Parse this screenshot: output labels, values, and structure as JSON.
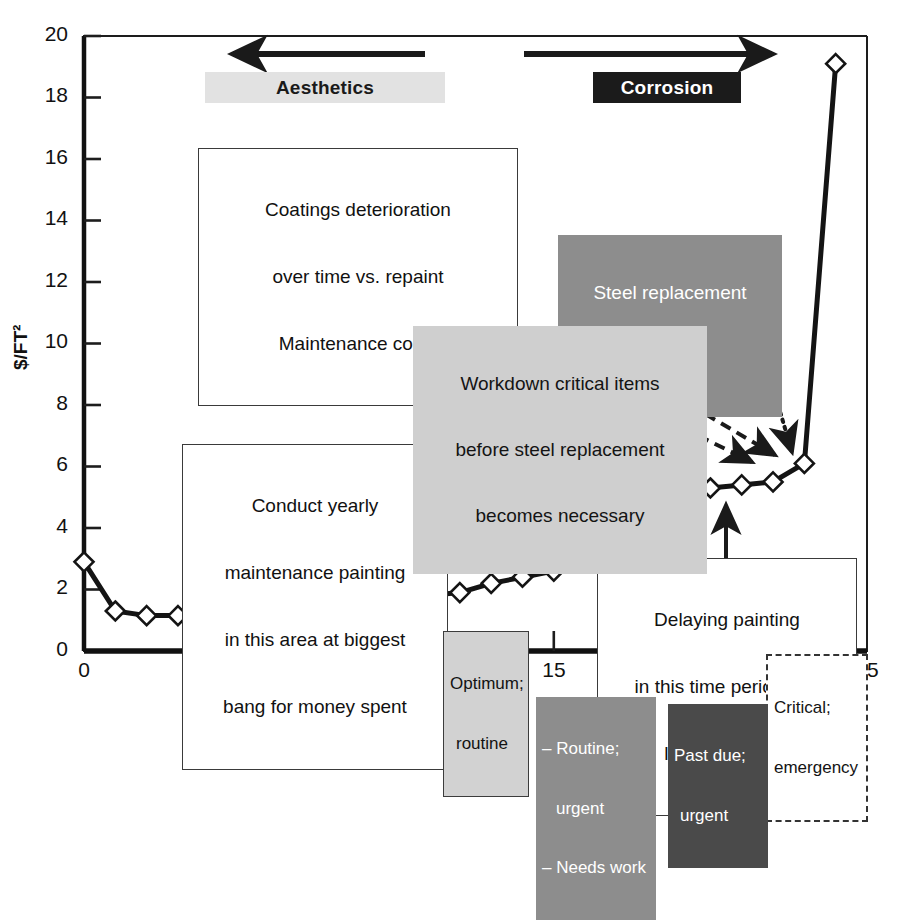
{
  "chart_data": {
    "type": "line",
    "title": "",
    "xlabel": "Years",
    "ylabel": "$/FT2",
    "ylabel_display": "$/FT²",
    "xlim": [
      0,
      25
    ],
    "ylim": [
      0,
      20
    ],
    "xticks": [
      "0",
      "5",
      "10",
      "15",
      "20",
      "25"
    ],
    "xtick_values": [
      0,
      5,
      10,
      15,
      20,
      25
    ],
    "yticks": [
      "0",
      "2",
      "4",
      "6",
      "8",
      "10",
      "12",
      "14",
      "16",
      "18",
      "20"
    ],
    "ytick_values": [
      0,
      2,
      4,
      6,
      8,
      10,
      12,
      14,
      16,
      18,
      20
    ],
    "grid": false,
    "legend_position": "below-axis",
    "series": [
      {
        "name": "Maintenance cost per square foot",
        "marker": "diamond-open",
        "x": [
          0,
          1,
          2,
          3,
          4,
          5,
          6,
          7,
          8,
          9,
          10,
          11,
          12,
          13,
          14,
          15,
          16,
          17,
          18,
          19,
          20,
          21,
          22,
          23,
          24
        ],
        "values": [
          2.9,
          1.3,
          1.15,
          1.15,
          1.15,
          1.15,
          1.15,
          1.15,
          1.2,
          1.35,
          1.4,
          1.8,
          1.9,
          2.2,
          2.4,
          2.6,
          3.0,
          3.3,
          3.9,
          4.5,
          5.3,
          5.4,
          5.5,
          6.1,
          19.1
        ]
      }
    ],
    "annotations": [
      {
        "id": "aesthetics",
        "text": "Aesthetics",
        "style": "light-banner"
      },
      {
        "id": "corrosion",
        "text": "Corrosion",
        "style": "dark-banner"
      },
      {
        "id": "coatings",
        "text": "Coatings deterioration\nover time vs. repaint\nMaintenance costs",
        "style": "white-box"
      },
      {
        "id": "steel-replacement",
        "text": "Steel replacement\nbegins",
        "style": "gray-mid"
      },
      {
        "id": "workdown",
        "text": "Workdown critical items\nbefore steel replacement\nbecomes necessary",
        "style": "gray-light"
      },
      {
        "id": "conduct-yearly",
        "text": "Conduct yearly\nmaintenance painting\nin this area at biggest\nbang for money spent",
        "style": "white-box"
      },
      {
        "id": "delaying",
        "text": "Delaying painting\nin this time period has\nlittle cost effect",
        "style": "white-box"
      }
    ],
    "axis_markers": [
      {
        "id": "optimum",
        "text": "Optimum;\nroutine",
        "at_year": 12.2,
        "style": "boxed-gray"
      },
      {
        "id": "critical",
        "text": "Critical;\nemergency",
        "at_year": 23.4,
        "style": "dashed-white"
      }
    ],
    "legend_chips": [
      {
        "id": "routine-urgent",
        "text": "– Routine;\n    urgent\n– Needs work",
        "style": "gray-mid"
      },
      {
        "id": "past-due",
        "text": "Past due;\nurgent",
        "style": "gray-dark"
      }
    ]
  },
  "axis": {
    "y_title": "$/FT²",
    "x_title": "Years"
  },
  "banners": {
    "aesthetics": "Aesthetics",
    "corrosion": "Corrosion"
  },
  "callouts": {
    "coatings_l1": "Coatings deterioration",
    "coatings_l2": "over time vs. repaint",
    "coatings_l3": "Maintenance costs",
    "conduct_l1": "Conduct yearly",
    "conduct_l2": "maintenance painting",
    "conduct_l3": "in this area at biggest",
    "conduct_l4": "bang for money spent",
    "delaying_l1": "Delaying painting",
    "delaying_l2": "in this time period has",
    "delaying_l3": "little cost effect",
    "steel_l1": "Steel replacement",
    "steel_l2": "begins",
    "workdown_l1": "Workdown critical items",
    "workdown_l2": "before steel replacement",
    "workdown_l3": "becomes necessary"
  },
  "markers": {
    "optimum_l1": "Optimum;",
    "optimum_l2": "routine",
    "critical_l1": "Critical;",
    "critical_l2": "emergency"
  },
  "legend": {
    "routine_l1": "– Routine;",
    "routine_l2": "urgent",
    "routine_l3": "– Needs work",
    "pastdue_l1": "Past due;",
    "pastdue_l2": "urgent"
  },
  "colors": {
    "ink": "#111111",
    "banner_light": "#e2e2e2",
    "banner_dark": "#1b1b1b",
    "gray_light": "#cfcfcf",
    "gray_mid": "#8d8d8d",
    "gray_dark": "#4a4a4a"
  }
}
